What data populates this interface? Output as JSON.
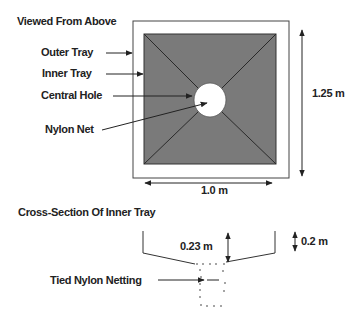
{
  "top_view": {
    "title": "Viewed From Above",
    "labels": {
      "outer_tray": "Outer Tray",
      "inner_tray": "Inner Tray",
      "central_hole": "Central Hole",
      "nylon_net": "Nylon Net"
    },
    "dimensions": {
      "height": "1.25 m",
      "width": "1.0 m"
    }
  },
  "cross_section": {
    "title": "Cross-Section Of Inner Tray",
    "labels": {
      "tied_nylon_netting": "Tied Nylon Netting"
    },
    "dimensions": {
      "depth_inner": "0.23 m",
      "depth_side": "0.2 m"
    }
  },
  "colors": {
    "inner_tray_fill": "#7a7a7a",
    "line": "#222222",
    "outer_tray_fill": "#ffffff"
  }
}
